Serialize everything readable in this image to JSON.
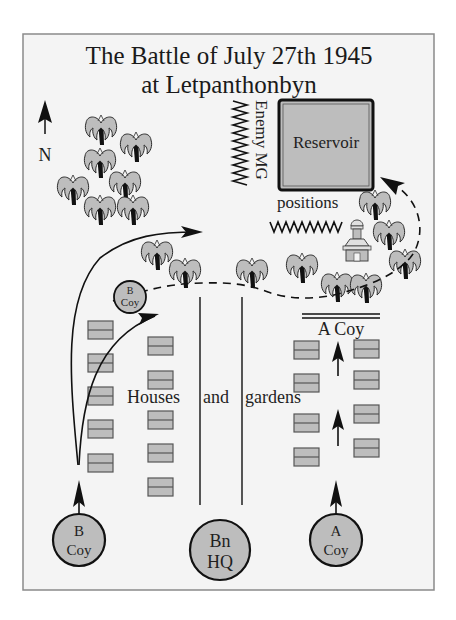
{
  "title": {
    "line1": "The Battle of July 27th 1945",
    "line2": "at Letpanthonbyn"
  },
  "compass": {
    "label": "N",
    "icon": "north-arrow-icon"
  },
  "labels": {
    "reservoir": "Reservoir",
    "enemy_mg": "Enemy MG",
    "positions": "positions",
    "houses": "Houses",
    "and": "and",
    "gardens": "gardens",
    "a_coy_line": "A Coy"
  },
  "units": [
    {
      "id": "b-coy-start",
      "line1": "B",
      "line2": "Coy",
      "cx": 79,
      "cy": 540,
      "r": 26
    },
    {
      "id": "bn-hq",
      "line1": "Bn",
      "line2": "HQ",
      "cx": 220,
      "cy": 550,
      "r": 30
    },
    {
      "id": "a-coy-start",
      "line1": "A",
      "line2": "Coy",
      "cx": 336,
      "cy": 540,
      "r": 26
    },
    {
      "id": "b-coy-forward",
      "line1": "B",
      "line2": "Coy",
      "cx": 130,
      "cy": 297,
      "r": 16
    }
  ],
  "colors": {
    "background": "#f4f4f4",
    "frame": "#8a8a8a",
    "fill_grey": "#bdbdbd",
    "stroke": "#2a2a2a",
    "ink": "#111111"
  }
}
